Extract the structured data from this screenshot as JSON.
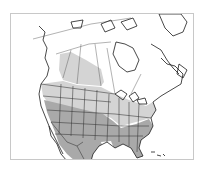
{
  "map": {
    "region": "North America",
    "projection": "conic",
    "colors": {
      "background": "#ffffff",
      "frame": "#c8c8c8",
      "land": "#ffffff",
      "outline": "#1a1a1a",
      "range_summer": "#d4d4d4",
      "range_year_round": "#a9a9a9"
    },
    "layers": [
      {
        "id": "range_summer",
        "label": "light shaded range",
        "color": "#d4d4d4"
      },
      {
        "id": "range_year_round",
        "label": "dark shaded range",
        "color": "#a9a9a9"
      }
    ]
  }
}
